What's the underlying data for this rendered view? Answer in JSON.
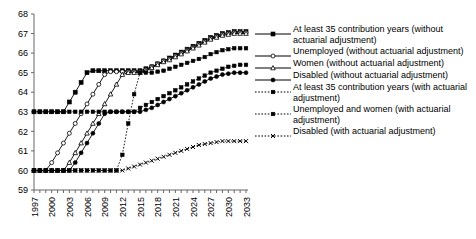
{
  "chart_data": {
    "type": "line",
    "title": "",
    "xlabel": "",
    "ylabel": "",
    "xlim": [
      1997,
      2033
    ],
    "ylim": [
      59,
      68
    ],
    "grid": false,
    "legend_position": "right",
    "xticks": [
      "1997",
      "2000",
      "2003",
      "2006",
      "2009",
      "2012",
      "2015",
      "2018",
      "2021",
      "2024",
      "2027",
      "2030",
      "2033"
    ],
    "yticks": [
      "59",
      "60",
      "61",
      "62",
      "63",
      "64",
      "65",
      "66",
      "67",
      "68"
    ],
    "x": [
      1997,
      1998,
      1999,
      2000,
      2001,
      2002,
      2003,
      2004,
      2005,
      2006,
      2007,
      2008,
      2009,
      2010,
      2011,
      2012,
      2013,
      2014,
      2015,
      2016,
      2017,
      2018,
      2019,
      2020,
      2021,
      2022,
      2023,
      2024,
      2025,
      2026,
      2027,
      2028,
      2029,
      2030,
      2031,
      2032,
      2033
    ],
    "series": [
      {
        "name": "At least 35 contribution years (without actuarial adjustment)",
        "marker": "filled-square",
        "dash": "solid",
        "values": [
          63,
          63,
          63,
          63,
          63,
          63,
          63.5,
          64,
          64.5,
          65,
          65.1,
          65.1,
          65.1,
          65.1,
          65.1,
          65.1,
          65.1,
          65.1,
          65.1,
          65.2,
          65.3,
          65.45,
          65.6,
          65.75,
          65.9,
          66.05,
          66.2,
          66.35,
          66.5,
          66.65,
          66.8,
          66.9,
          67,
          67.05,
          67.1,
          67.1,
          67.1
        ]
      },
      {
        "name": "Unemployed (without actuarial adjustment)",
        "marker": "open-circle",
        "dash": "solid",
        "values": [
          60,
          60,
          60,
          60.4,
          60.9,
          61.4,
          61.9,
          62.4,
          62.9,
          63.4,
          63.9,
          64.4,
          64.9,
          65.05,
          65.05,
          65.05,
          65.05,
          65.05,
          65.05,
          65.15,
          65.3,
          65.45,
          65.6,
          65.7,
          65.85,
          66,
          66.15,
          66.3,
          66.45,
          66.6,
          66.75,
          66.85,
          66.95,
          67,
          67.05,
          67.05,
          67.05
        ]
      },
      {
        "name": "Women (without actuarial adjustment)",
        "marker": "open-triangle",
        "dash": "solid",
        "values": [
          60,
          60,
          60,
          60,
          60,
          60,
          60.4,
          60.9,
          61.4,
          61.9,
          62.4,
          62.9,
          63.4,
          63.9,
          64.4,
          64.9,
          65.0,
          65.0,
          65.0,
          65.1,
          65.25,
          65.4,
          65.55,
          65.65,
          65.8,
          65.95,
          66.1,
          66.25,
          66.4,
          66.55,
          66.7,
          66.8,
          66.9,
          66.95,
          67,
          67,
          67
        ]
      },
      {
        "name": "Disabled (without actuarial adjustment)",
        "marker": "filled-circle",
        "dash": "solid",
        "values": [
          60,
          60,
          60,
          60,
          60,
          60,
          60,
          60.4,
          60.9,
          61.4,
          61.9,
          62.4,
          62.9,
          63,
          63,
          63,
          63,
          63,
          63,
          63.1,
          63.2,
          63.35,
          63.5,
          63.65,
          63.8,
          63.95,
          64.1,
          64.25,
          64.4,
          64.55,
          64.7,
          64.8,
          64.9,
          64.95,
          65,
          65,
          65
        ]
      },
      {
        "name": "At least 35 contribution years (with actuarial adjustment)",
        "marker": "dotted-square",
        "dash": "dotted",
        "values": [
          63,
          63,
          63,
          63,
          63,
          63,
          63,
          63,
          63,
          63,
          63,
          63,
          63,
          63,
          63,
          63,
          63,
          63,
          63.2,
          63.35,
          63.5,
          63.65,
          63.8,
          63.95,
          64.1,
          64.25,
          64.4,
          64.55,
          64.7,
          64.85,
          65,
          65.1,
          65.2,
          65.3,
          65.35,
          65.4,
          65.4
        ]
      },
      {
        "name": "Unemployed and women (with actuarial adjustment)",
        "marker": "dotted-square",
        "dash": "dotted",
        "values": [
          60,
          60,
          60,
          60,
          60,
          60,
          60,
          60,
          60,
          60,
          60,
          60,
          60,
          60,
          60,
          60.8,
          62.4,
          63.9,
          65.0,
          65.0,
          65.0,
          65.05,
          65.1,
          65.2,
          65.3,
          65.4,
          65.5,
          65.6,
          65.7,
          65.8,
          65.95,
          66.05,
          66.15,
          66.2,
          66.25,
          66.25,
          66.25
        ]
      },
      {
        "name": "Disabled (with actuarial adjustment)",
        "marker": "dotted-cross",
        "dash": "dotted",
        "values": [
          60,
          60,
          60,
          60,
          60,
          60,
          60,
          60,
          60,
          60,
          60,
          60,
          60,
          60,
          60,
          60,
          60.1,
          60.2,
          60.3,
          60.4,
          60.5,
          60.6,
          60.7,
          60.8,
          60.9,
          61,
          61.1,
          61.2,
          61.3,
          61.35,
          61.4,
          61.45,
          61.5,
          61.5,
          61.5,
          61.5,
          61.5
        ]
      }
    ]
  },
  "legend": {
    "items": [
      {
        "label": "At least 35 contribution years (without actuarial adjustment)",
        "marker": "filled-square",
        "dash": "solid"
      },
      {
        "label": "Unemployed (without actuarial adjustment)",
        "marker": "open-circle",
        "dash": "solid"
      },
      {
        "label": "Women (without actuarial adjustment)",
        "marker": "open-triangle",
        "dash": "solid"
      },
      {
        "label": "Disabled (without actuarial adjustment)",
        "marker": "filled-circle",
        "dash": "solid"
      },
      {
        "label": "At least 35 contribution years (with actuarial adjustment)",
        "marker": "dotted-square",
        "dash": "dotted"
      },
      {
        "label": "Unemployed and women (with actuarial adjustment)",
        "marker": "dotted-square",
        "dash": "dotted"
      },
      {
        "label": "Disabled (with actuarial adjustment)",
        "marker": "dotted-cross",
        "dash": "dotted"
      }
    ]
  },
  "colors": {
    "line": "#000000",
    "axis": "#555555",
    "text": "#000000"
  }
}
